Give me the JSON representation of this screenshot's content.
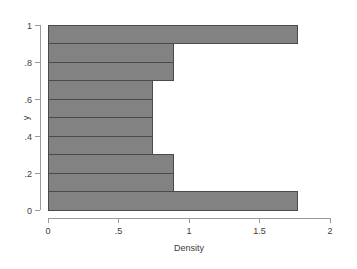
{
  "chart_data": {
    "type": "bar",
    "orientation": "horizontal",
    "title": "",
    "subtitle": "",
    "xlabel": "Density",
    "ylabel": "y",
    "xlim": [
      0,
      2
    ],
    "ylim": [
      0,
      1
    ],
    "grid": false,
    "legend": null,
    "x_ticks": [
      {
        "value": 0,
        "label": "0"
      },
      {
        "value": 0.5,
        "label": ".5"
      },
      {
        "value": 1,
        "label": "1"
      },
      {
        "value": 1.5,
        "label": "1.5"
      },
      {
        "value": 2,
        "label": "2"
      }
    ],
    "y_ticks": [
      {
        "value": 0,
        "label": "0"
      },
      {
        "value": 0.2,
        "label": ".2"
      },
      {
        "value": 0.4,
        "label": ".4"
      },
      {
        "value": 0.6,
        "label": ".6"
      },
      {
        "value": 0.8,
        "label": ".8"
      },
      {
        "value": 1,
        "label": "1"
      }
    ],
    "bin_width": 0.1,
    "categories": [
      "0.0-0.1",
      "0.1-0.2",
      "0.2-0.3",
      "0.3-0.4",
      "0.4-0.5",
      "0.5-0.6",
      "0.6-0.7",
      "0.7-0.8",
      "0.8-0.9",
      "0.9-1.0"
    ],
    "bin_starts": [
      0,
      0.1,
      0.2,
      0.3,
      0.4,
      0.5,
      0.6,
      0.7,
      0.8,
      0.9
    ],
    "values": [
      1.77,
      0.89,
      0.89,
      0.74,
      0.74,
      0.74,
      0.74,
      0.89,
      0.89,
      1.77
    ],
    "bar_fill_color": "#828282",
    "bar_stroke_color": "#4a4a4a",
    "axis_color": "#9a9a9a",
    "text_color": "#3c3c3c",
    "background_color": "#ffffff"
  },
  "geometry": {
    "x0_px": 48,
    "x_scale_px_per_unit": 141,
    "y0_px": 210,
    "y_scale_px_per_unit": 185
  }
}
